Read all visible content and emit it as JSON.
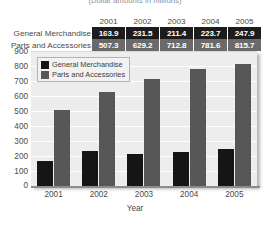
{
  "caption": "(Dollar amounts in millions)",
  "table": {
    "corner_label": "",
    "year_headers": [
      "2001",
      "2002",
      "2003",
      "2004",
      "2005"
    ],
    "rows": [
      {
        "label": "General Merchandise",
        "style": "gm",
        "values": [
          "163.9",
          "231.5",
          "211.4",
          "223.7",
          "247.9"
        ]
      },
      {
        "label": "Parts and Accessories",
        "style": "pa",
        "values": [
          "507.3",
          "629.2",
          "712.8",
          "781.6",
          "815.7"
        ]
      }
    ]
  },
  "legend": {
    "items": [
      {
        "label": "General Merchandise",
        "color": "#151515"
      },
      {
        "label": "Parts and Accessories",
        "color": "#575757"
      }
    ]
  },
  "axis": {
    "y_ticks": [
      "900",
      "800",
      "700",
      "600",
      "500",
      "400",
      "300",
      "200",
      "100",
      "0"
    ],
    "x_ticks": [
      "2001",
      "2002",
      "2003",
      "2004",
      "2005"
    ],
    "x_title": "Year"
  },
  "chart_data": {
    "type": "bar",
    "title": "",
    "subtitle": "(Dollar amounts in millions)",
    "xlabel": "Year",
    "ylabel": "",
    "categories": [
      "2001",
      "2002",
      "2003",
      "2004",
      "2005"
    ],
    "series": [
      {
        "name": "General Merchandise",
        "color": "#151515",
        "values": [
          163.9,
          231.5,
          211.4,
          223.7,
          247.9
        ]
      },
      {
        "name": "Parts and Accessories",
        "color": "#575757",
        "values": [
          507.3,
          629.2,
          712.8,
          781.6,
          815.7
        ]
      }
    ],
    "ylim": [
      0,
      900
    ],
    "ytick_step": 100,
    "yticks": [
      0,
      100,
      200,
      300,
      400,
      500,
      600,
      700,
      800,
      900
    ],
    "grid": "horizontal",
    "legend_position": "top-left",
    "plot_background": "#ededed",
    "units": "millions of dollars"
  }
}
